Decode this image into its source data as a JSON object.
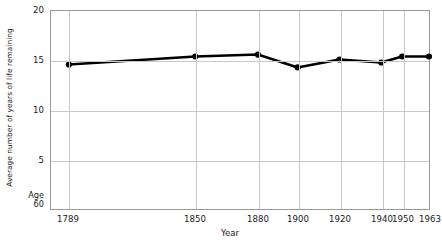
{
  "chart_data": {
    "type": "line",
    "title": "",
    "xlabel": "Year",
    "ylabel": "Average number of years of life remaining",
    "x": [
      1789,
      1850,
      1880,
      1900,
      1920,
      1940,
      1950,
      1963
    ],
    "xtick_labels": [
      "1789",
      "1850",
      "1880",
      "1900",
      "1920",
      "1940",
      "1950",
      "1963"
    ],
    "values": [
      14.6,
      15.4,
      15.6,
      14.3,
      15.1,
      14.8,
      15.4,
      15.4
    ],
    "ylim": [
      0,
      20
    ],
    "ytick_labels": [
      "20",
      "15",
      "10",
      "5"
    ],
    "ytick_values": [
      20,
      15,
      10,
      5
    ],
    "baseline_label_line1": "Age",
    "baseline_label_line2": "60",
    "grid": true,
    "legend": "none",
    "series_color": "#000000",
    "grid_color": "#c8c8c8",
    "frame_color": "#9a9a9a",
    "marker": "circle",
    "annotations": []
  },
  "axis": {
    "y_title": "Average number of years of life remaining",
    "x_title": "Year"
  }
}
